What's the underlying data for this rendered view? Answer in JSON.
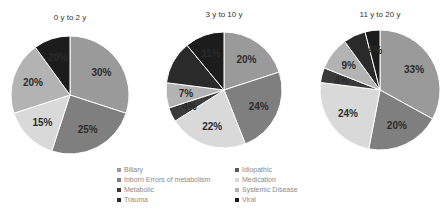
{
  "chart_data": [
    {
      "type": "pie",
      "title": "0 y to 2 y",
      "labels": [
        "Biliary",
        "Inborn Errors of metabolism",
        "Medication",
        "Systemic Disease",
        "Viral"
      ],
      "values": [
        30,
        25,
        15,
        20,
        10
      ],
      "data_labels": [
        "30%",
        "25%",
        "15%",
        "20%",
        "20%"
      ]
    },
    {
      "type": "pie",
      "title": "3 y to 10 y",
      "labels": [
        "Biliary",
        "Inborn Errors of metabolism",
        "Medication",
        "Metabolic",
        "Systemic Disease",
        "Trauma",
        "Viral"
      ],
      "values": [
        20,
        24,
        22,
        4,
        7,
        12,
        11
      ],
      "data_labels": [
        "20%",
        "24%",
        "22%",
        "4%",
        "7%",
        "12%",
        "11%"
      ]
    },
    {
      "type": "pie",
      "title": "11 y to 20 y",
      "labels": [
        "Biliary",
        "Inborn Errors of metabolism",
        "Medication",
        "Metabolic",
        "Systemic Disease",
        "Trauma",
        "Viral"
      ],
      "values": [
        33,
        20,
        24,
        4,
        9,
        6,
        4
      ],
      "data_labels": [
        "33%",
        "20%",
        "24%",
        "4%",
        "9%",
        "6%",
        "4%"
      ]
    }
  ],
  "legend": [
    {
      "label": "Biliary",
      "color": "#9a9a9a"
    },
    {
      "label": "Idiopathic",
      "color": "#5a5a5a"
    },
    {
      "label": "Inborn Errors of metabolism",
      "color": "#7f7f7f"
    },
    {
      "label": "Medication",
      "color": "#d9d9d9"
    },
    {
      "label": "Metabolic",
      "color": "#3a3a3a"
    },
    {
      "label": "Systemic Disease",
      "color": "#b3b3b3"
    },
    {
      "label": "Trauma",
      "color": "#2a2a2a"
    },
    {
      "label": "Viral",
      "color": "#1c1c1c"
    }
  ],
  "colors": {
    "Biliary": "#9a9a9a",
    "Idiopathic": "#5a5a5a",
    "Inborn Errors of metabolism": "#7f7f7f",
    "Medication": "#d9d9d9",
    "Metabolic": "#3a3a3a",
    "Systemic Disease": "#b3b3b3",
    "Trauma": "#2a2a2a",
    "Viral": "#1c1c1c"
  },
  "pies": [
    {
      "title": "0 y to 2 y",
      "cx": 70,
      "cy": 95,
      "r": 59
    },
    {
      "title": "3 y to 10 y",
      "cx": 224,
      "cy": 90,
      "r": 58
    },
    {
      "title": "11 y to 20 y",
      "cx": 380,
      "cy": 90,
      "r": 60
    }
  ]
}
